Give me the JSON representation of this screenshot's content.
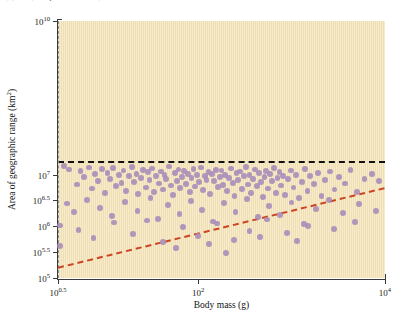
{
  "figure": {
    "caption_fragment": "(b) Bats (Chiroptera, Mammalia)",
    "background_color": "#f7ebc9",
    "point_color": "#a98bba",
    "trend_color": "#cc4422",
    "threshold_color": "#111111",
    "bodymass_cutoff_color": "#8097af"
  },
  "chart_data": {
    "type": "scatter",
    "title": "",
    "xlabel": "Body mass (g)",
    "ylabel": "Area of geographic range (km²)",
    "xscale": "log10",
    "yscale": "log10",
    "xlim": [
      0.5,
      4.0
    ],
    "ylim": [
      5.0,
      10.0
    ],
    "xticks": [
      0.5,
      2.0,
      4.0
    ],
    "xticklabels": [
      "10^0.5",
      "10^2",
      "10^4"
    ],
    "yticks": [
      10.0,
      7.0,
      6.5,
      6.0,
      5.5,
      5.0
    ],
    "yticklabels": [
      "10^10",
      "10^7",
      "10^6.5",
      "10^6",
      "10^5.5",
      "10^5"
    ],
    "grid": false,
    "legend": null,
    "annotations": [
      {
        "name": "maximum-range-threshold",
        "type": "hline",
        "y": 7.27,
        "style": "dashed",
        "color": "#111111",
        "linewidth": 2.4
      },
      {
        "name": "minimum-body-mass-cutoff",
        "type": "vline",
        "x": 0.5,
        "style": "dashed",
        "color": "#8097af",
        "linewidth": 1.8
      },
      {
        "name": "minimum-range-constraint-line",
        "type": "line",
        "x0": 0.5,
        "y0": 5.2,
        "x1": 4.0,
        "y1": 6.75,
        "style": "dashed",
        "color": "#cc4422",
        "linewidth": 2.0
      }
    ],
    "points": [
      [
        0.56,
        7.18
      ],
      [
        0.62,
        7.11
      ],
      [
        0.7,
        6.82
      ],
      [
        0.74,
        7.08
      ],
      [
        0.78,
        6.96
      ],
      [
        0.83,
        7.15
      ],
      [
        0.86,
        6.74
      ],
      [
        0.9,
        7.02
      ],
      [
        0.93,
        6.88
      ],
      [
        0.97,
        7.12
      ],
      [
        1.0,
        6.66
      ],
      [
        1.03,
        7.05
      ],
      [
        1.06,
        6.92
      ],
      [
        1.09,
        7.14
      ],
      [
        1.12,
        6.79
      ],
      [
        1.15,
        7.0
      ],
      [
        1.18,
        6.85
      ],
      [
        1.2,
        7.09
      ],
      [
        1.23,
        6.7
      ],
      [
        1.26,
        6.98
      ],
      [
        1.29,
        7.16
      ],
      [
        1.31,
        6.87
      ],
      [
        1.34,
        7.03
      ],
      [
        1.36,
        6.63
      ],
      [
        1.39,
        6.94
      ],
      [
        1.41,
        7.1
      ],
      [
        1.44,
        6.76
      ],
      [
        1.46,
        7.06
      ],
      [
        1.48,
        6.9
      ],
      [
        1.51,
        7.13
      ],
      [
        1.53,
        6.68
      ],
      [
        1.55,
        6.99
      ],
      [
        1.58,
        6.84
      ],
      [
        1.6,
        7.07
      ],
      [
        1.62,
        6.72
      ],
      [
        1.64,
        7.01
      ],
      [
        1.66,
        6.93
      ],
      [
        1.69,
        7.17
      ],
      [
        1.71,
        6.8
      ],
      [
        1.73,
        6.61
      ],
      [
        1.75,
        7.04
      ],
      [
        1.77,
        6.89
      ],
      [
        1.79,
        7.11
      ],
      [
        1.81,
        6.75
      ],
      [
        1.83,
        6.97
      ],
      [
        1.85,
        7.08
      ],
      [
        1.87,
        6.83
      ],
      [
        1.89,
        7.02
      ],
      [
        1.91,
        6.67
      ],
      [
        1.93,
        6.95
      ],
      [
        1.95,
        7.12
      ],
      [
        1.97,
        6.78
      ],
      [
        1.99,
        7.0
      ],
      [
        2.01,
        6.86
      ],
      [
        2.03,
        7.15
      ],
      [
        2.05,
        6.71
      ],
      [
        2.07,
        6.99
      ],
      [
        2.09,
        6.91
      ],
      [
        2.11,
        7.06
      ],
      [
        2.13,
        6.64
      ],
      [
        2.15,
        7.03
      ],
      [
        2.17,
        6.88
      ],
      [
        2.19,
        7.1
      ],
      [
        2.21,
        6.77
      ],
      [
        2.23,
        6.96
      ],
      [
        2.25,
        7.09
      ],
      [
        2.27,
        6.81
      ],
      [
        2.29,
        7.01
      ],
      [
        2.31,
        6.69
      ],
      [
        2.33,
        6.94
      ],
      [
        2.35,
        7.13
      ],
      [
        2.37,
        6.85
      ],
      [
        2.39,
        6.59
      ],
      [
        2.41,
        7.05
      ],
      [
        2.43,
        6.9
      ],
      [
        2.45,
        7.07
      ],
      [
        2.47,
        6.73
      ],
      [
        2.49,
        6.98
      ],
      [
        2.51,
        7.16
      ],
      [
        2.53,
        6.82
      ],
      [
        2.55,
        7.0
      ],
      [
        2.57,
        6.65
      ],
      [
        2.59,
        6.93
      ],
      [
        2.61,
        7.11
      ],
      [
        2.63,
        6.79
      ],
      [
        2.65,
        7.04
      ],
      [
        2.67,
        6.87
      ],
      [
        2.69,
        6.57
      ],
      [
        2.71,
        6.97
      ],
      [
        2.73,
        7.08
      ],
      [
        2.75,
        6.74
      ],
      [
        2.77,
        7.02
      ],
      [
        2.79,
        6.89
      ],
      [
        2.81,
        7.14
      ],
      [
        2.83,
        6.66
      ],
      [
        2.85,
        6.95
      ],
      [
        2.87,
        7.06
      ],
      [
        2.89,
        6.8
      ],
      [
        2.91,
        6.99
      ],
      [
        2.93,
        6.62
      ],
      [
        2.96,
        6.92
      ],
      [
        2.99,
        7.09
      ],
      [
        3.02,
        6.76
      ],
      [
        3.05,
        7.01
      ],
      [
        3.08,
        6.55
      ],
      [
        3.11,
        6.86
      ],
      [
        3.14,
        7.12
      ],
      [
        3.17,
        6.7
      ],
      [
        3.2,
        6.98
      ],
      [
        3.24,
        6.83
      ],
      [
        3.28,
        7.04
      ],
      [
        3.32,
        6.6
      ],
      [
        3.36,
        6.9
      ],
      [
        3.41,
        7.07
      ],
      [
        3.46,
        6.72
      ],
      [
        3.51,
        6.96
      ],
      [
        3.57,
        6.84
      ],
      [
        3.63,
        7.1
      ],
      [
        3.7,
        6.67
      ],
      [
        3.78,
        6.93
      ],
      [
        3.86,
        7.03
      ],
      [
        3.94,
        6.88
      ],
      [
        0.6,
        6.45
      ],
      [
        0.67,
        6.28
      ],
      [
        0.81,
        6.52
      ],
      [
        0.95,
        6.36
      ],
      [
        1.08,
        6.2
      ],
      [
        1.22,
        6.48
      ],
      [
        1.35,
        6.31
      ],
      [
        1.49,
        6.55
      ],
      [
        1.57,
        6.15
      ],
      [
        1.68,
        6.42
      ],
      [
        1.8,
        6.25
      ],
      [
        1.92,
        6.5
      ],
      [
        2.04,
        6.33
      ],
      [
        2.16,
        6.1
      ],
      [
        2.28,
        6.46
      ],
      [
        2.4,
        6.29
      ],
      [
        2.52,
        6.53
      ],
      [
        2.64,
        6.18
      ],
      [
        2.76,
        6.4
      ],
      [
        2.88,
        6.23
      ],
      [
        3.0,
        6.47
      ],
      [
        3.13,
        6.05
      ],
      [
        3.26,
        6.35
      ],
      [
        3.4,
        6.51
      ],
      [
        3.55,
        6.26
      ],
      [
        3.72,
        6.44
      ],
      [
        3.9,
        6.3
      ],
      [
        0.52,
        6.02
      ],
      [
        0.52,
        5.63
      ],
      [
        0.72,
        5.93
      ],
      [
        0.88,
        5.78
      ],
      [
        1.1,
        6.08
      ],
      [
        1.3,
        5.86
      ],
      [
        1.45,
        6.12
      ],
      [
        1.62,
        5.7
      ],
      [
        1.84,
        5.99
      ],
      [
        2.0,
        5.82
      ],
      [
        2.2,
        6.06
      ],
      [
        2.38,
        5.74
      ],
      [
        2.55,
        5.91
      ],
      [
        2.74,
        6.14
      ],
      [
        2.95,
        5.88
      ],
      [
        3.18,
        6.01
      ],
      [
        3.45,
        5.95
      ],
      [
        3.68,
        6.09
      ],
      [
        1.76,
        5.58
      ],
      [
        2.12,
        5.66
      ],
      [
        2.3,
        5.49
      ],
      [
        2.66,
        5.8
      ],
      [
        3.06,
        5.72
      ]
    ]
  }
}
